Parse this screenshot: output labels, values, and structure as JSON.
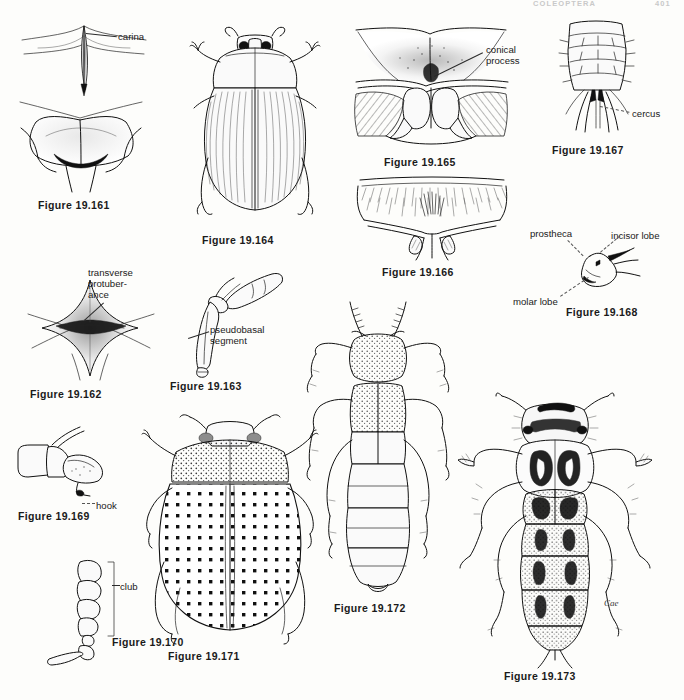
{
  "page": {
    "running_head_title": "COLEOPTERA",
    "running_head_page": "401",
    "background_color": "#fdfdfb",
    "ink_color": "#111111",
    "artist_monogram": "Cae",
    "width": 684,
    "height": 700
  },
  "figures": [
    {
      "id": "19.161",
      "caption": "Figure 19.161",
      "subject": "pronotum-and-prosternum-with-carina",
      "labels": [
        {
          "text": "carina",
          "target": "median-carina"
        }
      ]
    },
    {
      "id": "19.164",
      "caption": "Figure 19.164",
      "subject": "beetle-dorsal-habitus-striate-elytra",
      "labels": []
    },
    {
      "id": "19.165",
      "caption": "Figure 19.165",
      "subject": "prosternum-with-conical-process",
      "labels": [
        {
          "text": "conical\nprocess",
          "target": "conical-process"
        }
      ]
    },
    {
      "id": "19.167",
      "caption": "Figure 19.167",
      "subject": "larval-abdomen-apex-with-cerci",
      "labels": [
        {
          "text": "cercus",
          "target": "cercus"
        }
      ]
    },
    {
      "id": "19.166",
      "caption": "Figure 19.166",
      "subject": "setose-abdominal-apex",
      "labels": []
    },
    {
      "id": "19.168",
      "caption": "Figure 19.168",
      "subject": "mandible-with-lobes",
      "labels": [
        {
          "text": "prostheca",
          "target": "prostheca"
        },
        {
          "text": "incisor lobe",
          "target": "incisor-lobe"
        },
        {
          "text": "molar lobe",
          "target": "molar-lobe"
        }
      ]
    },
    {
      "id": "19.162",
      "caption": "Figure 19.162",
      "subject": "sternum-with-transverse-protuberance",
      "labels": [
        {
          "text": "transverse protuber- ance",
          "target": "transverse-protuberance"
        }
      ]
    },
    {
      "id": "19.163",
      "caption": "Figure 19.163",
      "subject": "leg-with-pseudobasal-segment",
      "labels": [
        {
          "text": "pseudobasal segment",
          "target": "pseudobasal-segment"
        }
      ]
    },
    {
      "id": "19.169",
      "caption": "Figure 19.169",
      "subject": "tarsus-with-hook",
      "labels": [
        {
          "text": "hook",
          "target": "hook"
        }
      ]
    },
    {
      "id": "19.170",
      "caption": "Figure 19.170",
      "subject": "antenna-with-club",
      "labels": [
        {
          "text": "club",
          "target": "antennal-club"
        }
      ]
    },
    {
      "id": "19.171",
      "caption": "Figure 19.171",
      "subject": "beetle-dorsal-habitus-punctate-elytra",
      "labels": []
    },
    {
      "id": "19.172",
      "caption": "Figure 19.172",
      "subject": "rove-beetle-dorsal-habitus",
      "labels": []
    },
    {
      "id": "19.173",
      "caption": "Figure 19.173",
      "subject": "patterned-beetle-larva-dorsal",
      "labels": []
    }
  ],
  "label_text": {
    "carina": "carina",
    "conical_process_l1": "conical",
    "conical_process_l2": "process",
    "cercus": "cercus",
    "prostheca": "prostheca",
    "incisor_lobe": "incisor lobe",
    "molar_lobe": "molar lobe",
    "transverse_l1": "transverse",
    "transverse_l2": "protuber-",
    "transverse_l3": "ance",
    "pseudobasal_l1": "pseudobasal",
    "pseudobasal_l2": "segment",
    "hook": "hook",
    "club": "club"
  },
  "captions": {
    "f161": "Figure 19.161",
    "f162": "Figure 19.162",
    "f163": "Figure 19.163",
    "f164": "Figure 19.164",
    "f165": "Figure 19.165",
    "f166": "Figure 19.166",
    "f167": "Figure 19.167",
    "f168": "Figure 19.168",
    "f169": "Figure 19.169",
    "f170": "Figure 19.170",
    "f171": "Figure 19.171",
    "f172": "Figure 19.172",
    "f173": "Figure 19.173"
  }
}
